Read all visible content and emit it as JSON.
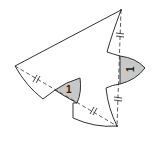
{
  "diagram": {
    "type": "geometric-construction",
    "colors": {
      "stroke": "#333333",
      "shade": "#c8c8c8",
      "background": "#ffffff"
    },
    "vertices": {
      "top": [
        121,
        10
      ],
      "left": [
        15,
        66
      ],
      "bottom": [
        117,
        126
      ]
    },
    "labels": [
      {
        "id": "angle-left",
        "text": "1"
      },
      {
        "id": "angle-right",
        "text": "1"
      }
    ],
    "tick_marks": [
      {
        "segment": "top-to-right-notch",
        "count": 2
      },
      {
        "segment": "left-to-left-shade",
        "count": 2
      },
      {
        "segment": "left-shade-to-bottom",
        "count": 2
      },
      {
        "segment": "right-shade-to-bottom",
        "count": 2
      }
    ]
  }
}
